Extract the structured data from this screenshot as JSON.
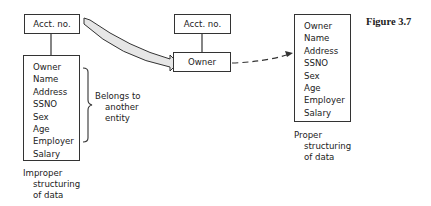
{
  "figure_label": "Figure 3.7",
  "left_diagram": {
    "key_box": "Acct. no.",
    "attributes": [
      "Owner",
      "Name",
      "Address",
      "SSNO",
      "Sex",
      "Age",
      "Employer",
      "Salary"
    ],
    "brace_note": [
      "Belongs to",
      "another",
      "entity"
    ],
    "caption": [
      "Improper",
      "structuring",
      "of data"
    ]
  },
  "middle_diagram": {
    "key_box": "Acct. no.",
    "owner_box": "Owner"
  },
  "right_diagram": {
    "attributes": [
      "Owner",
      "Name",
      "Address",
      "SSNO",
      "Sex",
      "Age",
      "Employer",
      "Salary"
    ],
    "caption": [
      "Proper",
      "structuring",
      "of data"
    ]
  }
}
